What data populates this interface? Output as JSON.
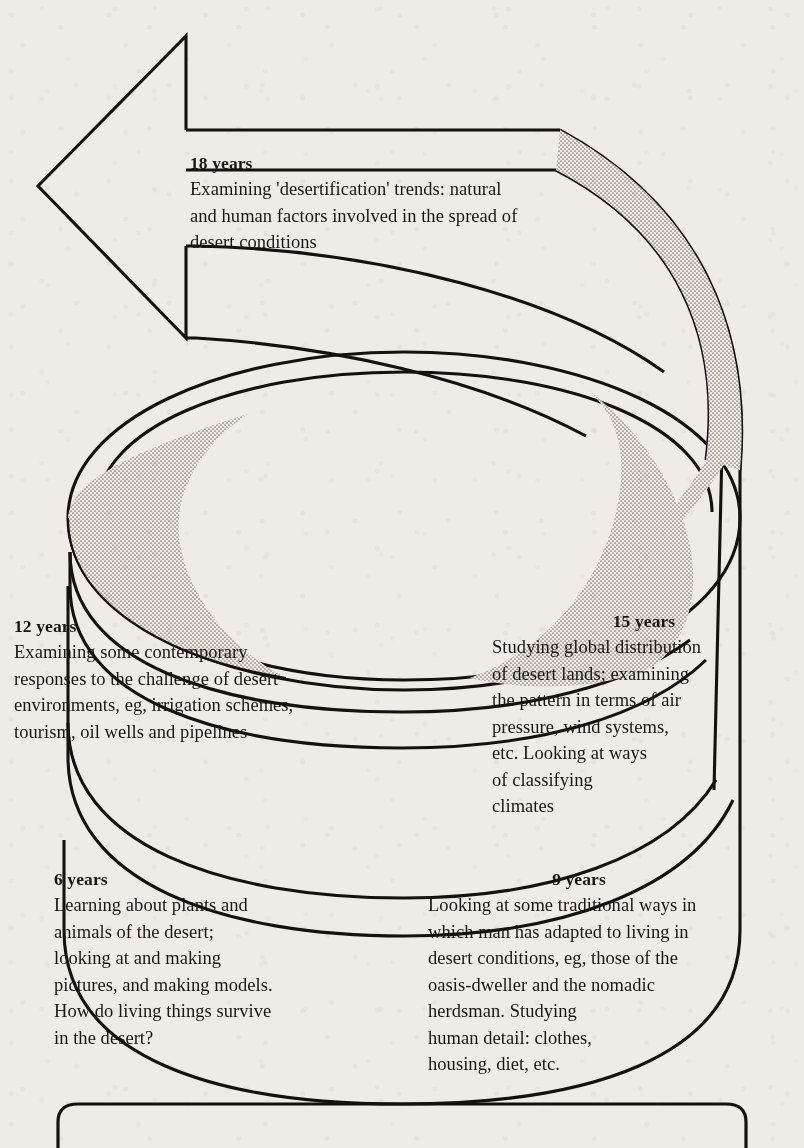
{
  "diagram": {
    "type": "spiral-helix-arrow",
    "reading_direction": "bottom-to-top",
    "arrow": {
      "name": "upward-spiral-arrowhead",
      "points": "up-left"
    },
    "ink_color": "#1a1614",
    "paper_color": "#efece7",
    "shading_color": "#9a968f"
  },
  "stages": [
    {
      "id": "age-6",
      "heading": "6 years",
      "body": "Learning about plants and\nanimals of the desert;\nlooking at and making\npictures, and making models.\n  How do living things survive\n     in the desert?"
    },
    {
      "id": "age-9",
      "heading": "9 years",
      "body": "Looking at some traditional ways in\nwhich man has adapted to living in\ndesert conditions, eg, those of the\noasis-dweller and the nomadic\nherdsman. Studying\nhuman detail: clothes,\nhousing, diet, etc."
    },
    {
      "id": "age-12",
      "heading": "12 years",
      "body": "Examining some contemporary\nresponses  to the challenge of desert\nenvironments, eg, irrigation schemes,\ntourism, oil wells  and pipelines"
    },
    {
      "id": "age-15",
      "heading": "15 years",
      "body": "Studying global distribution\nof desert lands; examining\nthe pattern in terms of air\npressure, wind systems,\netc. Looking at ways\nof classifying\nclimates"
    },
    {
      "id": "age-18",
      "heading": "18 years",
      "body": "Examining 'desertification' trends: natural\nand human factors involved in the spread of\ndesert conditions"
    }
  ]
}
